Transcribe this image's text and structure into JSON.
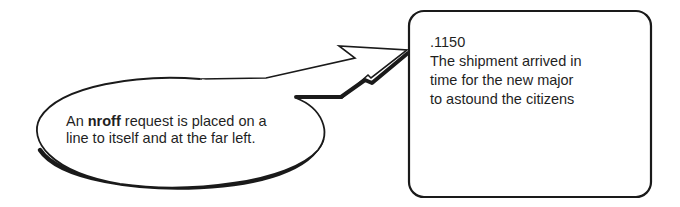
{
  "callout": {
    "text_before": "An ",
    "keyword": "nroff",
    "text_after_line1": " request is placed on a",
    "line2": "line to itself and at the far left."
  },
  "example_box": {
    "lines": [
      ".1150",
      "The shipment arrived in",
      "time for the new major",
      "to astound the citizens"
    ]
  },
  "colors": {
    "stroke": "#1a1a1a",
    "background": "#ffffff"
  }
}
